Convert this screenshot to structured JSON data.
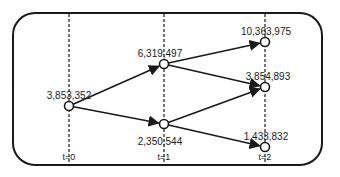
{
  "diagram": {
    "time_labels": [
      "t=0",
      "t=1",
      "t=2"
    ],
    "nodes": [
      {
        "id": "n0",
        "time": 0,
        "value": "3,853,352"
      },
      {
        "id": "n1u",
        "time": 1,
        "value": "6,319,497"
      },
      {
        "id": "n1d",
        "time": 1,
        "value": "2,350,544"
      },
      {
        "id": "n2uu",
        "time": 2,
        "value": "10,363,975"
      },
      {
        "id": "n2ud",
        "time": 2,
        "value": "3,854,893"
      },
      {
        "id": "n2dd",
        "time": 2,
        "value": "1,433,832"
      }
    ],
    "edges": [
      {
        "from": "n0",
        "to": "n1u"
      },
      {
        "from": "n0",
        "to": "n1d"
      },
      {
        "from": "n1u",
        "to": "n2uu"
      },
      {
        "from": "n1u",
        "to": "n2ud"
      },
      {
        "from": "n1d",
        "to": "n2ud"
      },
      {
        "from": "n1d",
        "to": "n2dd"
      }
    ],
    "colors": {
      "stroke": "#1a1a1a",
      "background": "#ffffff"
    }
  }
}
